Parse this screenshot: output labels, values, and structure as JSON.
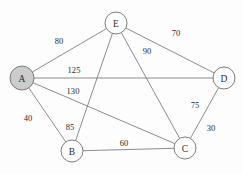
{
  "figure": {
    "background_color": "#fdfdfd",
    "width": 243,
    "height": 174
  },
  "style": {
    "edge_color": "#6e6e6e",
    "node_stroke_color": "#6e6e6e",
    "node_fill_default": "#ffffff",
    "node_fill_highlight": "#cccccc",
    "label_color": "#2b2b2b"
  },
  "chart_data": {
    "type": "diagram",
    "diagram_kind": "weighted-undirected-graph",
    "title": "",
    "nodes": [
      {
        "id": "A",
        "label": "A",
        "x": 22,
        "y": 78,
        "r": 12,
        "highlighted": true,
        "fill": "#cccccc"
      },
      {
        "id": "B",
        "label": "B",
        "x": 72,
        "y": 151,
        "r": 11,
        "highlighted": false,
        "fill": "#ffffff"
      },
      {
        "id": "C",
        "label": "C",
        "x": 185,
        "y": 148,
        "r": 11,
        "highlighted": false,
        "fill": "#ffffff"
      },
      {
        "id": "D",
        "label": "D",
        "x": 224,
        "y": 78,
        "r": 11,
        "highlighted": false,
        "fill": "#ffffff"
      },
      {
        "id": "E",
        "label": "E",
        "x": 116,
        "y": 23,
        "r": 11,
        "highlighted": false,
        "fill": "#ffffff"
      }
    ],
    "edges": [
      {
        "id": "A-E",
        "source": "A",
        "target": "E",
        "weight": 80,
        "label": "80",
        "label_x": 59,
        "label_y": 41
      },
      {
        "id": "A-D",
        "source": "A",
        "target": "D",
        "weight": 125,
        "label": "125",
        "label_x": 74,
        "label_y": 70
      },
      {
        "id": "A-C",
        "source": "A",
        "target": "C",
        "weight": 130,
        "label": "130",
        "label_x": 73,
        "label_y": 91
      },
      {
        "id": "A-B",
        "source": "A",
        "target": "B",
        "weight": 40,
        "label": "40",
        "label_x": 28,
        "label_y": 118
      },
      {
        "id": "B-E",
        "source": "B",
        "target": "E",
        "weight": 85,
        "label": "85",
        "label_x": 70,
        "label_y": 127
      },
      {
        "id": "B-C",
        "source": "B",
        "target": "C",
        "weight": 60,
        "label": "60",
        "label_x": 124,
        "label_y": 143
      },
      {
        "id": "C-E",
        "source": "C",
        "target": "E",
        "weight": 90,
        "label": "90",
        "label_x": 147,
        "label_y": 51
      },
      {
        "id": "D-E",
        "source": "D",
        "target": "E",
        "weight": 70,
        "label": "70",
        "label_x": 176,
        "label_y": 33
      },
      {
        "id": "C-D",
        "source": "C",
        "target": "D",
        "weight": 75,
        "label": "75",
        "label_x": 195,
        "label_y": 105
      },
      {
        "id": "C-D-alt",
        "source": "C",
        "target": "D",
        "weight": 30,
        "label": "30",
        "label_x": 211,
        "label_y": 128
      }
    ],
    "node_count": 5,
    "edge_label_count": 10
  }
}
